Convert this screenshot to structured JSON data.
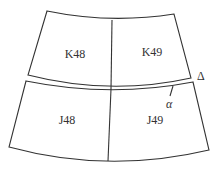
{
  "diagram": {
    "sheets": [
      {
        "id": "K48",
        "label": "K48"
      },
      {
        "id": "K49",
        "label": "K49"
      },
      {
        "id": "J48",
        "label": "J48"
      },
      {
        "id": "J49",
        "label": "J49"
      }
    ],
    "annotations": {
      "delta": "Δ",
      "alpha": "α"
    },
    "colors": {
      "line": "#333333",
      "background": "#ffffff"
    }
  }
}
